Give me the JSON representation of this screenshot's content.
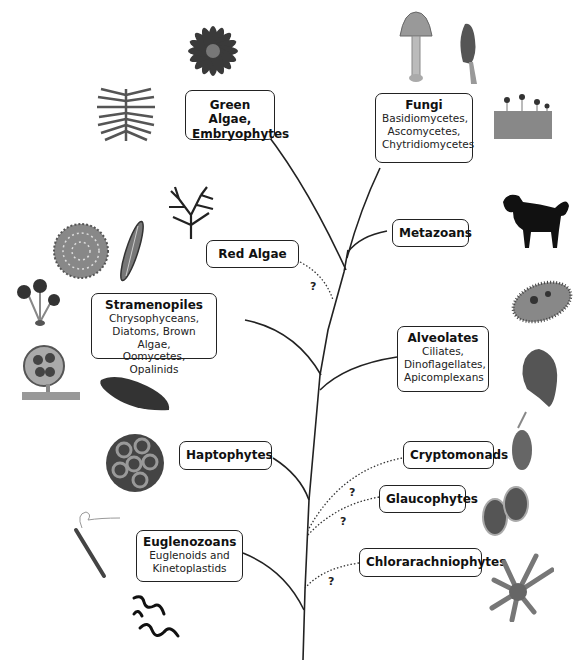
{
  "diagram": {
    "type": "phylogenetic-tree",
    "groups": [
      {
        "id": "green-algae",
        "title": "Green Algae, Embryophytes",
        "title_lines": [
          "Green Algae,",
          "Embryophytes"
        ],
        "sub": "",
        "uncertain": false
      },
      {
        "id": "fungi",
        "title": "Fungi",
        "sub_lines": [
          "Basidiomycetes,",
          "Ascomycetes,",
          "Chytridiomycetes"
        ],
        "uncertain": false
      },
      {
        "id": "metazoans",
        "title": "Metazoans",
        "uncertain": false
      },
      {
        "id": "red-algae",
        "title": "Red Algae",
        "uncertain": true
      },
      {
        "id": "stramenopiles",
        "title": "Stramenopiles",
        "sub_lines": [
          "Chrysophyceans,",
          "Diatoms, Brown Algae,",
          "Oomycetes, Opalinids"
        ],
        "uncertain": false
      },
      {
        "id": "alveolates",
        "title": "Alveolates",
        "sub_lines": [
          "Ciliates,",
          "Dinoflagellates,",
          "Apicomplexans"
        ],
        "uncertain": false
      },
      {
        "id": "haptophytes",
        "title": "Haptophytes",
        "uncertain": false
      },
      {
        "id": "cryptomonads",
        "title": "Cryptomonads",
        "uncertain": true
      },
      {
        "id": "glaucophytes",
        "title": "Glaucophytes",
        "uncertain": true
      },
      {
        "id": "euglenozoans",
        "title": "Euglenozoans",
        "sub_lines": [
          "Euglenoids and",
          "Kinetoplastids"
        ],
        "uncertain": false
      },
      {
        "id": "chlorarachniophytes",
        "title": "Chlorarachniophytes",
        "uncertain": true
      }
    ],
    "uncertain_marker": "?",
    "line_color": "#222222",
    "images": [
      "flower-icon",
      "desmid-icon",
      "mushroom-icon",
      "morel-icon",
      "slime-mold-icon",
      "red-seaweed-icon",
      "centric-diatom-icon",
      "pennate-diatom-icon",
      "dog-icon",
      "chrysophyte-icon",
      "oomycete-icon",
      "opalinid-icon",
      "ciliate-icon",
      "dinoflagellate-icon",
      "coccolithophore-icon",
      "cryptomonad-icon",
      "glaucophyte-icon",
      "euglena-icon",
      "trypanosome-icon",
      "chlorarachniophyte-icon"
    ]
  }
}
